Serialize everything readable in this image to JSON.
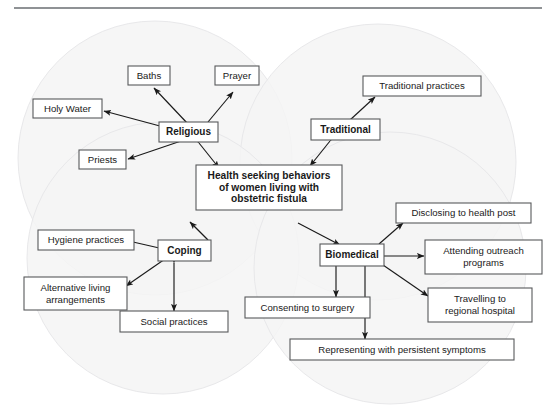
{
  "figure": {
    "top_rule": "horizontal-divider",
    "background_color": "#ffffff",
    "circle_fill_color": "#f4f4f5",
    "circle_stroke_color": "#e8e8ea",
    "box_stroke_color": "#58595b",
    "arrow_color": "#1a1a1a"
  },
  "center": {
    "line1": "Health seeking behaviors",
    "line2": "of women living with",
    "line3": "obstetric fistula"
  },
  "clusters": [
    {
      "id": "religious",
      "hub_label": "Religious",
      "nodes": [
        {
          "id": "baths",
          "label": "Baths"
        },
        {
          "id": "prayer",
          "label": "Prayer"
        },
        {
          "id": "holy-water",
          "label": "Holy Water"
        },
        {
          "id": "priests",
          "label": "Priests"
        }
      ]
    },
    {
      "id": "traditional",
      "hub_label": "Traditional",
      "nodes": [
        {
          "id": "traditional-practices",
          "label": "Traditional practices"
        }
      ]
    },
    {
      "id": "coping",
      "hub_label": "Coping",
      "nodes": [
        {
          "id": "hygiene-practices",
          "label": "Hygiene practices"
        },
        {
          "id": "alternative-living",
          "line1": "Alternative living",
          "line2": "arrangements"
        },
        {
          "id": "social-practices",
          "label": "Social practices"
        }
      ]
    },
    {
      "id": "biomedical",
      "hub_label": "Biomedical",
      "nodes": [
        {
          "id": "disclosing-health-post",
          "label": "Disclosing to health post"
        },
        {
          "id": "attending-outreach",
          "line1": "Attending outreach",
          "line2": "programs"
        },
        {
          "id": "travelling-hospital",
          "line1": "Travelling to",
          "line2": "regional hospital"
        },
        {
          "id": "consenting-surgery",
          "label": "Consenting to surgery"
        },
        {
          "id": "representing-symptoms",
          "label": "Representing with persistent symptoms"
        }
      ]
    }
  ]
}
